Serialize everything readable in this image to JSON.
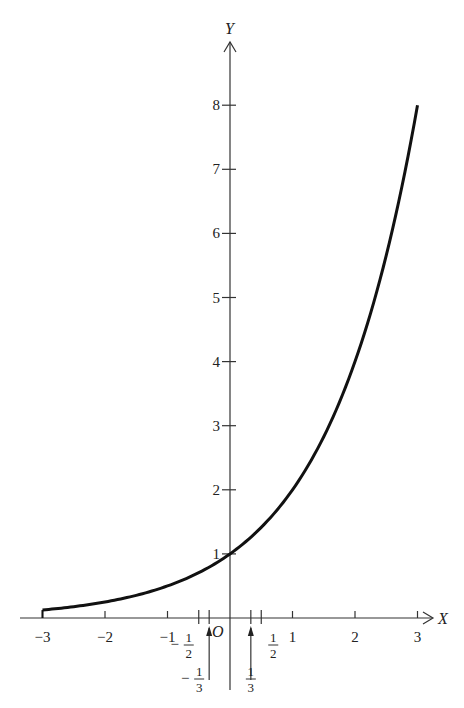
{
  "chart_data": {
    "type": "line",
    "title": "",
    "function": "y = 2^x",
    "xlabel": "X",
    "ylabel": "Y",
    "origin_label": "O",
    "xlim": [
      -3,
      3
    ],
    "ylim": [
      0,
      8
    ],
    "grid": false,
    "legend": null,
    "x_ticks": [
      -3,
      -2,
      -1,
      1,
      2,
      3
    ],
    "x_tick_labels": [
      "−3",
      "−2",
      "−1",
      "1",
      "2",
      "3"
    ],
    "y_ticks": [
      1,
      2,
      3,
      4,
      5,
      6,
      7,
      8
    ],
    "y_tick_labels": [
      "1",
      "2",
      "3",
      "4",
      "5",
      "6",
      "7",
      "8"
    ],
    "minor_x_ticks": [
      {
        "value": -0.5,
        "label_num": "1",
        "label_den": "2",
        "sign": "−"
      },
      {
        "value": -0.3333,
        "label_num": "1",
        "label_den": "3",
        "sign": "−"
      },
      {
        "value": 0.3333,
        "label_num": "1",
        "label_den": "3",
        "sign": ""
      },
      {
        "value": 0.5,
        "label_num": "1",
        "label_den": "2",
        "sign": ""
      }
    ],
    "series": [
      {
        "name": "y = 2^x",
        "x": [
          -3,
          -2.5,
          -2,
          -1.5,
          -1,
          -0.5,
          0,
          0.5,
          1,
          1.5,
          2,
          2.5,
          3
        ],
        "values": [
          0.125,
          0.177,
          0.25,
          0.354,
          0.5,
          0.707,
          1,
          1.414,
          2,
          2.828,
          4,
          5.657,
          8
        ]
      }
    ]
  }
}
